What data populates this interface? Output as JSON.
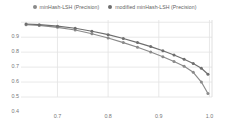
{
  "legend": {
    "position": "top-center",
    "marker_color": "#808080",
    "items": [
      {
        "label": "minHash-LSH (Precision)",
        "color": "#8a8a8a",
        "icon": "circle-marker-icon"
      },
      {
        "label": "modified minHash-LSH (Precision)",
        "color": "#6e6e6e",
        "icon": "circle-marker-icon"
      }
    ]
  },
  "axes": {
    "x": {
      "label": "Recall",
      "ticks": [
        "0.7",
        "0.8",
        "0.9",
        "1.0"
      ],
      "tick_values": [
        0.7,
        0.8,
        0.9,
        1.0
      ],
      "min": 0.628,
      "max": 1.005
    },
    "y": {
      "label": "",
      "ticks": [
        "0.9",
        "0.8",
        "0.7",
        "0.6",
        "0.5",
        "0.4"
      ],
      "tick_values": [
        0.9,
        0.8,
        0.7,
        0.6,
        0.5,
        0.4
      ],
      "min": 0.4,
      "max": 0.915
    }
  },
  "style": {
    "grid_color": "#e2e2e2",
    "frame_color": "#d8d8d8",
    "background": "#ffffff",
    "series_a_color": "#8a8a8a",
    "series_b_color": "#6e6e6e",
    "grid_on": true
  },
  "chart_data": {
    "type": "line",
    "title": "",
    "xlabel": "Recall",
    "ylabel": "Precision",
    "xlim": [
      0.628,
      1.005
    ],
    "ylim": [
      0.4,
      0.915
    ],
    "grid": true,
    "legend_position": "top-center",
    "series": [
      {
        "name": "minHash-LSH (Precision)",
        "color": "#8a8a8a",
        "marker": "circle",
        "x": [
          0.638,
          0.664,
          0.7,
          0.735,
          0.768,
          0.8,
          0.83,
          0.858,
          0.884,
          0.908,
          0.93,
          0.95,
          0.968,
          0.984,
          0.997
        ],
        "y": [
          0.884,
          0.879,
          0.866,
          0.848,
          0.823,
          0.795,
          0.764,
          0.733,
          0.701,
          0.669,
          0.637,
          0.605,
          0.565,
          0.5,
          0.423
        ]
      },
      {
        "name": "modified minHash-LSH (Precision)",
        "color": "#6e6e6e",
        "marker": "circle",
        "x": [
          0.638,
          0.664,
          0.7,
          0.735,
          0.768,
          0.8,
          0.83,
          0.858,
          0.884,
          0.908,
          0.93,
          0.95,
          0.968,
          0.984,
          0.997
        ],
        "y": [
          0.888,
          0.884,
          0.874,
          0.86,
          0.84,
          0.817,
          0.791,
          0.764,
          0.737,
          0.709,
          0.681,
          0.653,
          0.624,
          0.592,
          0.552
        ]
      }
    ]
  }
}
